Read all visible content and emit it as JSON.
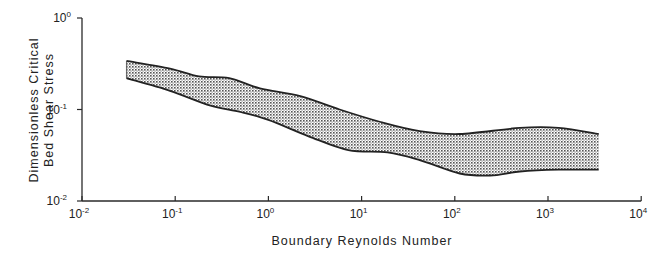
{
  "chart_data": {
    "type": "area",
    "title": "",
    "xlabel": "Boundary Reynolds Number",
    "ylabel_lines": [
      "Dimensionless Critical",
      "Bed Shear Stress"
    ],
    "ylabel": "Dimensionless Critical Bed Shear Stress",
    "xscale": "log",
    "yscale": "log",
    "xlim": [
      0.01,
      10000
    ],
    "ylim": [
      0.01,
      1
    ],
    "grid": false,
    "legend": null,
    "x_ticks": [
      {
        "value": 0.01,
        "base": "10",
        "exp": "-2"
      },
      {
        "value": 0.1,
        "base": "10",
        "exp": "-1"
      },
      {
        "value": 1,
        "base": "10",
        "exp": "0"
      },
      {
        "value": 10,
        "base": "10",
        "exp": "1"
      },
      {
        "value": 100,
        "base": "10",
        "exp": "2"
      },
      {
        "value": 1000,
        "base": "10",
        "exp": "3"
      },
      {
        "value": 10000,
        "base": "10",
        "exp": "4"
      }
    ],
    "y_ticks": [
      {
        "value": 0.01,
        "base": "10",
        "exp": "-2"
      },
      {
        "value": 0.1,
        "base": "10",
        "exp": "-1"
      },
      {
        "value": 1,
        "base": "10",
        "exp": "0"
      }
    ],
    "series": [
      {
        "name": "Upper bound",
        "x": [
          0.03,
          0.088,
          0.18,
          0.38,
          0.81,
          2.2,
          5.8,
          16,
          42,
          113,
          500,
          1300,
          3500
        ],
        "values": [
          0.34,
          0.28,
          0.23,
          0.22,
          0.17,
          0.14,
          0.1,
          0.073,
          0.058,
          0.054,
          0.063,
          0.063,
          0.054
        ]
      },
      {
        "name": "Lower bound",
        "x": [
          0.03,
          0.088,
          0.24,
          0.5,
          1.0,
          2.7,
          7.2,
          19,
          42,
          113,
          240,
          500,
          1300,
          3500
        ],
        "values": [
          0.22,
          0.16,
          0.11,
          0.094,
          0.077,
          0.051,
          0.036,
          0.034,
          0.028,
          0.02,
          0.019,
          0.021,
          0.022,
          0.022
        ]
      }
    ],
    "fill": {
      "between": [
        "Upper bound",
        "Lower bound"
      ],
      "pattern": "stipple",
      "color": "#9a9a9a"
    }
  },
  "colors": {
    "axis": "#2a2a2a",
    "band_edge": "#222222",
    "band_fill": "#a8a8a8"
  }
}
